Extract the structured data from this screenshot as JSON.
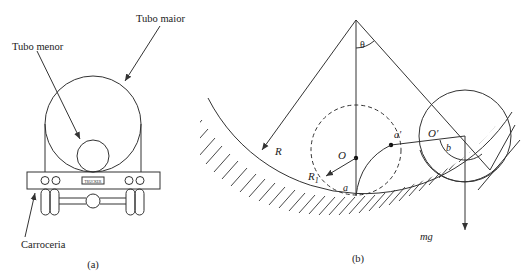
{
  "figure_a": {
    "label_large_tube": "Tubo maior",
    "label_small_tube": "Tubo menor",
    "label_body": "Carroceria",
    "plate_text": "TRUCKER",
    "caption": "(a)"
  },
  "figure_b": {
    "label_R": "R",
    "label_R1": "R",
    "label_R1_sub": "1",
    "label_theta": "θ",
    "label_O": "O",
    "label_O_prime": "O′",
    "label_a": "a",
    "label_a_prime": "a′",
    "label_b": "b",
    "label_mg": "mg",
    "caption": "(b)"
  },
  "colors": {
    "stroke": "#333333",
    "text": "#222222",
    "background": "#ffffff"
  }
}
